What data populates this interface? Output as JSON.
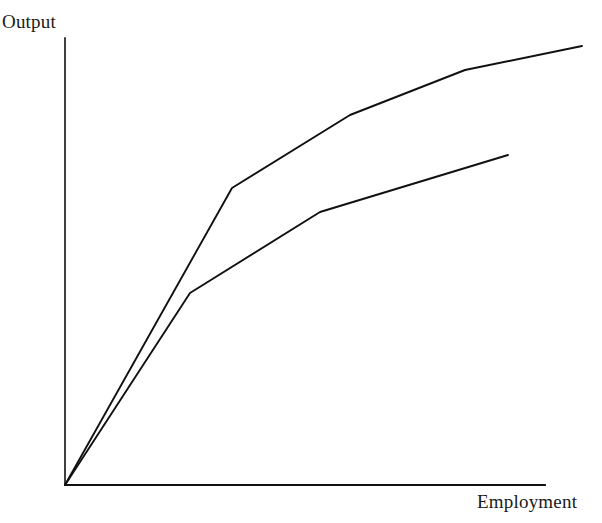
{
  "figure": {
    "background_color": "#ffffff",
    "line_color": "#111111",
    "axis_color": "#111111",
    "ylabel_text": "Output",
    "xlabel_text": "Employment"
  },
  "chart_data": {
    "type": "line",
    "title": "",
    "xlabel": "Employment",
    "ylabel": "Output",
    "xlim": [
      0,
      100
    ],
    "ylim": [
      0,
      100
    ],
    "grid": false,
    "legend": null,
    "axis_ticks": {
      "x": [],
      "y": []
    },
    "series": [
      {
        "name": "Upper curve",
        "color": "#111111",
        "points": [
          {
            "x": 0.0,
            "y": 0.0
          },
          {
            "x": 34.8,
            "y": 66.4
          },
          {
            "x": 59.4,
            "y": 82.7
          },
          {
            "x": 83.3,
            "y": 92.9
          },
          {
            "x": 107.7,
            "y": 98.2
          }
        ]
      },
      {
        "name": "Lower curve",
        "color": "#111111",
        "points": [
          {
            "x": 0.0,
            "y": 0.0
          },
          {
            "x": 26.0,
            "y": 42.9
          },
          {
            "x": 53.1,
            "y": 61.0
          },
          {
            "x": 92.3,
            "y": 73.8
          }
        ]
      }
    ],
    "pixel_geometry": {
      "origin": [
        65,
        485
      ],
      "y_axis_top": [
        65,
        38
      ],
      "x_axis_right": [
        545,
        485
      ],
      "upper_curve_px": [
        [
          65,
          485
        ],
        [
          232,
          188
        ],
        [
          350,
          115
        ],
        [
          465,
          70
        ],
        [
          582,
          46
        ]
      ],
      "lower_curve_px": [
        [
          65,
          485
        ],
        [
          190,
          293
        ],
        [
          320,
          212
        ],
        [
          508,
          155
        ]
      ]
    }
  }
}
